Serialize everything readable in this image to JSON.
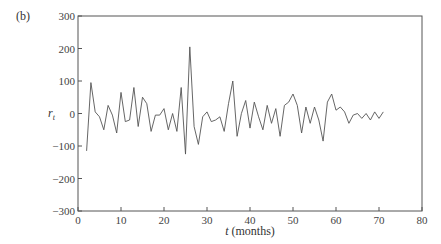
{
  "panel_label": "(b)",
  "chart_data": {
    "type": "line",
    "title": "",
    "xlabel": "t (months)",
    "ylabel": "r_t",
    "xlim": [
      0,
      80
    ],
    "ylim": [
      -300,
      300
    ],
    "xticks": [
      0,
      10,
      20,
      30,
      40,
      50,
      60,
      70,
      80
    ],
    "yticks": [
      -300,
      -200,
      -100,
      0,
      100,
      200,
      300
    ],
    "grid": false,
    "legend": null,
    "series": [
      {
        "name": "r_t",
        "color": "#555555",
        "x": [
          2,
          3,
          4,
          5,
          6,
          7,
          8,
          9,
          10,
          11,
          12,
          13,
          14,
          15,
          16,
          17,
          18,
          19,
          20,
          21,
          22,
          23,
          24,
          25,
          26,
          27,
          28,
          29,
          30,
          31,
          32,
          33,
          34,
          35,
          36,
          37,
          38,
          39,
          40,
          41,
          42,
          43,
          44,
          45,
          46,
          47,
          48,
          49,
          50,
          51,
          52,
          53,
          54,
          55,
          56,
          57,
          58,
          59,
          60,
          61,
          62,
          63,
          64,
          65,
          66,
          67,
          68,
          69,
          70,
          71
        ],
        "values": [
          -115,
          95,
          5,
          -10,
          -50,
          25,
          -5,
          -60,
          65,
          -25,
          -20,
          80,
          -40,
          50,
          30,
          -55,
          -5,
          -5,
          15,
          -50,
          0,
          -55,
          80,
          -125,
          205,
          -40,
          -95,
          -10,
          5,
          -25,
          -20,
          -10,
          -55,
          30,
          100,
          -70,
          0,
          40,
          -45,
          35,
          -10,
          -50,
          25,
          -30,
          15,
          -70,
          25,
          35,
          60,
          25,
          -60,
          20,
          -30,
          20,
          -20,
          -85,
          35,
          60,
          10,
          20,
          5,
          -30,
          -5,
          0,
          -15,
          0,
          -20,
          5,
          -15,
          5
        ]
      }
    ]
  }
}
